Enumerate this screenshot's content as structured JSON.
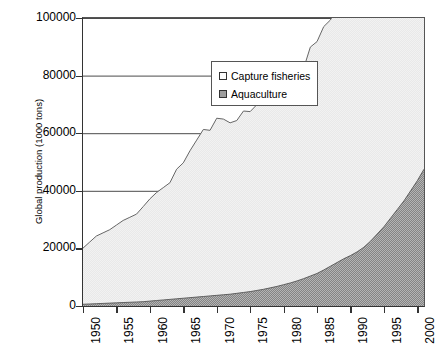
{
  "chart_data": {
    "type": "area",
    "stacked": true,
    "title": "",
    "xlabel": "",
    "ylabel": "Global production (1000 tons)",
    "xlim": [
      1950,
      2001
    ],
    "ylim": [
      0,
      100000
    ],
    "ytick_labels": [
      "100000",
      "80000",
      "60000",
      "40000",
      "20000",
      "0"
    ],
    "ytick_values": [
      100000,
      80000,
      60000,
      40000,
      20000,
      0
    ],
    "xtick_labels": [
      "1950",
      "1955",
      "1960",
      "1965",
      "1970",
      "1975",
      "1980",
      "1985",
      "1990",
      "1995",
      "2000"
    ],
    "xtick_values": [
      1950,
      1955,
      1960,
      1965,
      1970,
      1975,
      1980,
      1985,
      1990,
      1995,
      2000
    ],
    "grid": true,
    "legend_position": "upper-left-inside",
    "colors": {
      "capture_fill": "#f0f0f0",
      "aquaculture_fill": "#9e9e9e",
      "line": "#555555",
      "axis": "#333333",
      "grid": "#4a4a4a"
    },
    "x": [
      1950,
      1951,
      1952,
      1953,
      1954,
      1955,
      1956,
      1957,
      1958,
      1959,
      1960,
      1961,
      1962,
      1963,
      1964,
      1965,
      1966,
      1967,
      1968,
      1969,
      1970,
      1971,
      1972,
      1973,
      1974,
      1975,
      1976,
      1977,
      1978,
      1979,
      1980,
      1981,
      1982,
      1983,
      1984,
      1985,
      1986,
      1987,
      1988,
      1989,
      1990,
      1991,
      1992,
      1993,
      1994,
      1995,
      1996,
      1997,
      1998,
      1999,
      2000,
      2001
    ],
    "series": [
      {
        "name": "Aquaculture",
        "values": [
          600,
          700,
          800,
          900,
          1000,
          1100,
          1200,
          1300,
          1400,
          1500,
          1700,
          1900,
          2100,
          2300,
          2500,
          2700,
          2900,
          3100,
          3300,
          3500,
          3700,
          3900,
          4100,
          4400,
          4700,
          5000,
          5400,
          5800,
          6300,
          6800,
          7400,
          8000,
          8700,
          9500,
          10400,
          11300,
          12500,
          13800,
          15100,
          16400,
          17500,
          18800,
          20400,
          22500,
          25000,
          27500,
          30500,
          33500,
          36500,
          40000,
          43500,
          47500
        ]
      },
      {
        "name": "Capture fisheries",
        "values": [
          19500,
          21500,
          23500,
          24500,
          25500,
          27000,
          28500,
          29500,
          30500,
          33000,
          35500,
          37500,
          39000,
          40500,
          45000,
          47000,
          51000,
          54500,
          58000,
          57500,
          61500,
          61000,
          59500,
          60000,
          63000,
          62500,
          64500,
          65000,
          67500,
          68000,
          68500,
          70500,
          71500,
          73000,
          79500,
          80500,
          84500,
          85500,
          88500,
          87500,
          85000,
          85000,
          85000,
          86000,
          92000,
          92500,
          93500,
          94000,
          87000,
          92500,
          94500,
          93000
        ]
      }
    ],
    "legend": [
      {
        "label": "Capture fisheries",
        "swatch": "capture_fill"
      },
      {
        "label": "Aquaculture",
        "swatch": "aquaculture_fill"
      }
    ]
  }
}
